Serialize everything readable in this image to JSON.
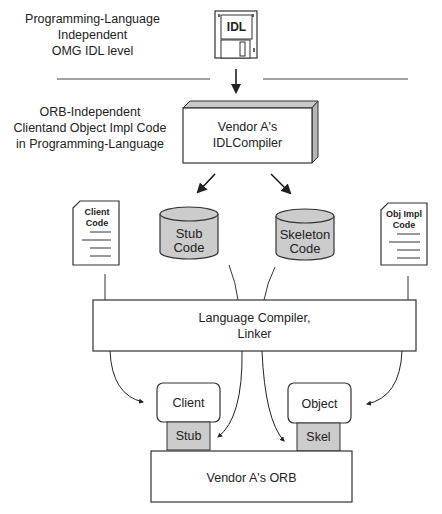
{
  "levels": {
    "idl_level": [
      "Programming-Language",
      "Independent",
      "OMG IDL level"
    ],
    "code_level": [
      "ORB-Independent",
      "Clientand Object Impl Code",
      "in Programming-Language"
    ]
  },
  "idl_disk": {
    "label": "IDL",
    "icon": "floppy-disk-icon"
  },
  "idl_compiler": {
    "line1": "Vendor A's",
    "line2": "IDLCompiler"
  },
  "documents": {
    "client_code": {
      "line1": "Client",
      "line2": "Code",
      "icon": "document-icon"
    },
    "obj_impl_code": {
      "line1": "Obj Impl",
      "line2": "Code",
      "icon": "document-icon"
    }
  },
  "stores": {
    "stub_code": {
      "line1": "Stub",
      "line2": "Code",
      "icon": "cylinder-icon"
    },
    "skeleton_code": {
      "line1": "Skeleton",
      "line2": "Code",
      "icon": "cylinder-icon"
    }
  },
  "language_compiler": {
    "line1": "Language Compiler,",
    "line2": "Linker"
  },
  "runtime": {
    "client": "Client",
    "stub": "Stub",
    "object": "Object",
    "skel": "Skel",
    "orb": "Vendor A's ORB"
  },
  "colors": {
    "stroke": "#333333",
    "shaded": "#cccccc",
    "box_side": "#b5b5b5",
    "box_top": "#c8c8c8"
  }
}
